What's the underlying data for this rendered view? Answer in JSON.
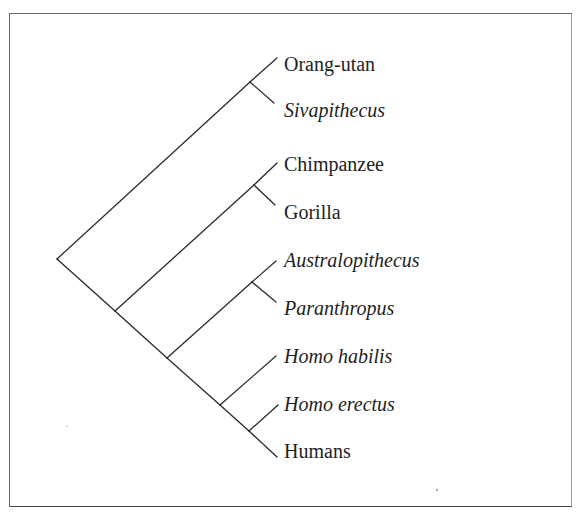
{
  "diagram": {
    "type": "cladogram",
    "orientation": "root-left, tips-right",
    "taxa": [
      {
        "id": "orang_utan",
        "label": "Orang-utan",
        "italic": false
      },
      {
        "id": "sivapithecus",
        "label": "Sivapithecus",
        "italic": true
      },
      {
        "id": "chimpanzee",
        "label": "Chimpanzee",
        "italic": false
      },
      {
        "id": "gorilla",
        "label": "Gorilla",
        "italic": false
      },
      {
        "id": "australopithecus",
        "label": "Australopithecus",
        "italic": true
      },
      {
        "id": "paranthropus",
        "label": "Paranthropus",
        "italic": true
      },
      {
        "id": "homo_habilis",
        "label": "Homo habilis",
        "italic": true
      },
      {
        "id": "homo_erectus",
        "label": "Homo erectus",
        "italic": true
      },
      {
        "id": "humans",
        "label": "Humans",
        "italic": false
      }
    ],
    "topology": "((Orang-utan,Sivapithecus),((Chimpanzee,Gorilla),((Australopithecus,Paranthropus),(Homo habilis,(Homo erectus,Humans)))))",
    "colors": {
      "line": "#2a2a2a",
      "text": "#1e1e1e",
      "frame": "#6a6a6a",
      "background": "#ffffff"
    }
  }
}
